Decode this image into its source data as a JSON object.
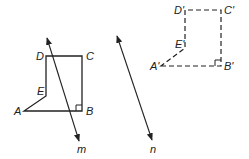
{
  "diagram": {
    "original_figure": {
      "style": "solid",
      "vertices": [
        {
          "label": "A",
          "x": 24,
          "y": 111
        },
        {
          "label": "B",
          "x": 82,
          "y": 111
        },
        {
          "label": "C",
          "x": 82,
          "y": 56
        },
        {
          "label": "D",
          "x": 46,
          "y": 56
        },
        {
          "label": "E",
          "x": 46,
          "y": 96
        }
      ],
      "right_angle_at": "B"
    },
    "image_figure": {
      "style": "dashed",
      "vertices": [
        {
          "label": "A'",
          "x": 161,
          "y": 66
        },
        {
          "label": "B'",
          "x": 221,
          "y": 66
        },
        {
          "label": "C'",
          "x": 221,
          "y": 10
        },
        {
          "label": "D'",
          "x": 185,
          "y": 10
        },
        {
          "label": "E'",
          "x": 185,
          "y": 48
        }
      ],
      "right_angle_at": "B'"
    },
    "lines": [
      {
        "label": "m",
        "x1": 47,
        "y1": 38,
        "x2": 79,
        "y2": 141
      },
      {
        "label": "n",
        "x1": 117,
        "y1": 36,
        "x2": 152,
        "y2": 140
      }
    ],
    "colors": {
      "stroke": "#222222",
      "background": "#ffffff"
    }
  }
}
